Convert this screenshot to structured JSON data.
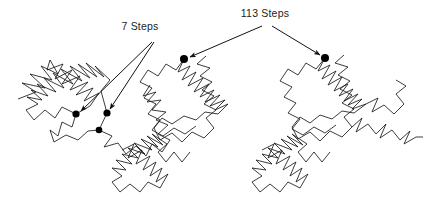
{
  "figure": {
    "background_color": "#ffffff",
    "line_color": "#1a1a1a",
    "marker_color": "#000000",
    "text_color": "#1c1c1c"
  },
  "annotations": {
    "small_scale": {
      "label": "7 Steps",
      "x": 140,
      "y": 30
    },
    "large_scale": {
      "label": "113 Steps",
      "x": 265,
      "y": 17
    }
  },
  "markers": [
    {
      "name": "small-scale-marker-a",
      "x": 76,
      "y": 114,
      "r": 3.6
    },
    {
      "name": "small-scale-marker-b",
      "x": 107,
      "y": 113,
      "r": 3.6
    },
    {
      "name": "small-scale-marker-c",
      "x": 99,
      "y": 130,
      "r": 3.3
    },
    {
      "name": "large-scale-marker-left",
      "x": 184,
      "y": 59,
      "r": 4.0
    },
    {
      "name": "large-scale-marker-right",
      "x": 325,
      "y": 58,
      "r": 4.0
    }
  ],
  "leaders": {
    "small_scale": [
      "M 152 42 L 81 111",
      "M 154 42 L 110 109"
    ],
    "large_scale": [
      "M 262 26 L 190 57",
      "M 272 26 L 320 55"
    ]
  },
  "chart_data": {
    "type": "line",
    "xlabel": "",
    "ylabel": "",
    "series": [
      {
        "name": "walk-cluster-left",
        "path": "M 18 99 L 36 92 L 22 83 L 45 88 L 30 74 L 52 80 L 41 66 L 58 74 L 50 60 L 47 70 L 63 64 L 55 79 L 72 70 L 62 84 L 80 76 L 70 90 L 88 82 L 76 95 L 93 88 L 84 101 L 99 93 L 90 106 L 76 114 L 62 107 L 55 118 L 45 110 L 34 120 L 26 110 L 38 104 L 27 97 L 42 100 L 31 90 L 48 96 L 37 84 L 56 92 L 44 78 L 64 88 L 53 73 L 73 84 L 61 69 L 82 81 L 70 66 L 90 78 L 78 64 L 97 77 L 86 63 L 104 77 L 95 66 L 110 80 L 101 91 L 107 113"
      },
      {
        "name": "walk-tail-left",
        "path": "M 76 114 L 72 127 L 62 122 L 58 136 L 50 130 L 54 142 L 66 135 L 78 140 L 88 131 L 99 130 L 107 113"
      },
      {
        "name": "walk-link-left-mid",
        "path": "M 99 130 L 112 136 L 104 147 L 118 143 L 126 154 L 136 146 L 146 156 L 152 144 L 162 152 L 170 140 L 158 134 L 168 125 L 156 120 L 166 112 L 152 110 L 161 100 L 147 102 L 156 92 L 143 96 L 150 85"
      },
      {
        "name": "walk-cluster-mid",
        "path": "M 184 59 L 178 72 L 190 66 L 182 80 L 196 72 L 188 86 L 203 78 L 194 92 L 209 84 L 200 97 L 214 90 L 205 102 L 220 95 L 210 106 L 225 100 L 215 110 L 228 104 L 218 114 L 205 112 L 196 120 L 184 116 L 172 124 L 162 118 L 154 128 L 160 140 L 172 133 L 182 142 L 192 132 L 204 138 L 214 128 L 206 118 L 216 110 L 204 104 L 214 96 L 202 90 L 212 82 L 200 76 L 210 68 L 197 64 L 206 56"
      },
      {
        "name": "walk-mid-extension",
        "path": "M 184 59 L 176 70 L 166 64 L 158 76 L 148 70 L 140 82 L 152 88 L 144 98 L 156 104 L 148 114 L 160 120 L 152 130 L 163 136 L 174 128 L 185 134 L 196 126"
      },
      {
        "name": "walk-lower-left-cluster",
        "path": "M 122 150 L 134 144 L 128 158 L 142 150 L 136 164 L 150 156 L 143 170 L 156 162 L 150 176 L 162 168 L 156 182 L 168 174 L 160 188 L 148 182 L 140 192 L 130 184 L 120 192 L 112 182 L 122 176 L 112 168 L 126 170 L 116 160 L 132 164 L 122 154 L 138 158 L 128 148 L 145 154 L 134 143 L 152 150 L 141 139 L 158 147 L 147 136 L 163 145 L 152 134 L 167 144 L 158 152 L 166 162 L 174 152 L 182 162 L 190 152"
      },
      {
        "name": "walk-cluster-right",
        "path": "M 325 58 L 318 71 L 330 65 L 322 79 L 336 71 L 328 85 L 342 77 L 334 91 L 348 84 L 339 96 L 353 89 L 344 101 L 358 94 L 348 105 L 362 99 L 352 109 L 366 104 L 354 113 L 342 111 L 332 119 L 320 115 L 310 123 L 300 117 L 292 127 L 298 139 L 310 132 L 320 141 L 330 131 L 342 137 L 352 127 L 344 117 L 354 109 L 342 103 L 352 95 L 340 89 L 350 81 L 338 75 L 348 67 L 335 63 L 344 55"
      },
      {
        "name": "walk-right-extension",
        "path": "M 325 58 L 316 69 L 306 63 L 298 75 L 288 69 L 280 81 L 292 87 L 284 97 L 296 103 L 288 113 L 300 119 L 292 129 L 303 135 L 314 127 L 325 133 L 336 125"
      },
      {
        "name": "walk-lower-right-cluster",
        "path": "M 262 150 L 274 144 L 268 158 L 282 150 L 276 164 L 290 156 L 283 170 L 296 162 L 290 176 L 302 168 L 296 182 L 308 174 L 300 188 L 288 182 L 280 192 L 270 184 L 260 192 L 252 182 L 262 176 L 252 168 L 266 170 L 256 160 L 272 164 L 262 154 L 278 158 L 268 148 L 285 154 L 274 143 L 292 150 L 281 139 L 298 147 L 287 136 L 303 145 L 292 134 L 307 144 L 298 152 L 306 162 L 314 152 L 322 162 L 330 152"
      },
      {
        "name": "walk-far-right-tail",
        "path": "M 352 127 L 362 118 L 356 132 L 368 124 L 376 134 L 386 124 L 380 138 L 392 130 L 400 140 L 410 131 L 404 144 L 416 137 L 423 137"
      },
      {
        "name": "walk-far-right-upper",
        "path": "M 366 104 L 378 98 L 372 112 L 384 105 L 394 114 L 404 104 L 396 94 L 406 86 L 396 80"
      }
    ]
  }
}
